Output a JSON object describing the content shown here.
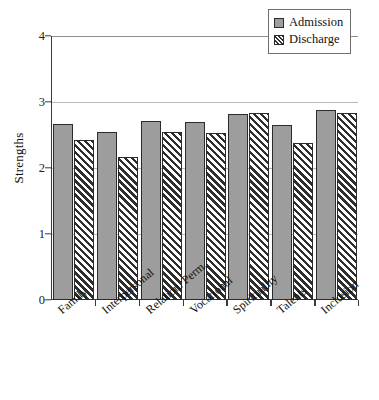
{
  "chart_data": {
    "type": "bar",
    "title": "",
    "xlabel": "",
    "ylabel": "Strengths",
    "ylim": [
      0,
      4
    ],
    "yticks": [
      0,
      1,
      2,
      3,
      4
    ],
    "ytick_labels": [
      "0",
      "1",
      "2",
      "3",
      "4"
    ],
    "grid": true,
    "legend_position": "top-right",
    "categories": [
      "Family",
      "Interpersonal",
      "Relation. Perm.",
      "Vocational",
      "Spirituality",
      "Talents",
      "Inclusion"
    ],
    "series": [
      {
        "name": "Admission",
        "values": [
          2.66,
          2.55,
          2.71,
          2.69,
          2.82,
          2.65,
          2.88
        ]
      },
      {
        "name": "Discharge",
        "values": [
          2.43,
          2.17,
          2.54,
          2.53,
          2.83,
          2.38,
          2.83
        ]
      }
    ]
  },
  "legend": {
    "items": [
      {
        "label": "Admission",
        "swatch": "solid-gray-swatch"
      },
      {
        "label": "Discharge",
        "swatch": "hatched-swatch"
      }
    ]
  },
  "axis": {
    "y_title": "Strengths"
  },
  "colors": {
    "admission_fill": "#9d9d9d",
    "discharge_hatch": "#2f2f2f",
    "bar_outline": "#2b2b2b",
    "gridline": "#b9b9b9",
    "axis": "#3a3a3a"
  }
}
